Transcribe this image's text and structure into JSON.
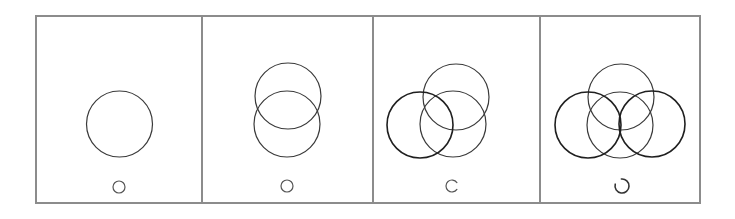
{
  "diagram": {
    "frame": {
      "x": 36,
      "y": 16,
      "width": 664,
      "height": 187,
      "color": "#8c8c8c"
    },
    "dividers_x": [
      202,
      373,
      540
    ],
    "line_color": "#3a3a3a",
    "panels": [
      {
        "id": "panel-1",
        "circles": [
          {
            "cx": 119.5,
            "cy": 124,
            "r": 33,
            "weight": "normal"
          }
        ],
        "marker": {
          "type": "circle",
          "cx": 119,
          "cy": 187,
          "r": 6
        }
      },
      {
        "id": "panel-2",
        "circles": [
          {
            "cx": 288,
            "cy": 96,
            "r": 33,
            "weight": "normal"
          },
          {
            "cx": 287,
            "cy": 124,
            "r": 33,
            "weight": "normal"
          }
        ],
        "marker": {
          "type": "circle",
          "cx": 287,
          "cy": 186,
          "r": 6
        }
      },
      {
        "id": "panel-3",
        "circles": [
          {
            "cx": 456,
            "cy": 97,
            "r": 33,
            "weight": "normal"
          },
          {
            "cx": 453,
            "cy": 124,
            "r": 33,
            "weight": "normal"
          },
          {
            "cx": 420,
            "cy": 125,
            "r": 33,
            "weight": "dark"
          }
        ],
        "marker": {
          "type": "arc-c",
          "cx": 452,
          "cy": 186,
          "r": 6
        }
      },
      {
        "id": "panel-4",
        "circles": [
          {
            "cx": 621,
            "cy": 97,
            "r": 33,
            "weight": "normal"
          },
          {
            "cx": 620,
            "cy": 125,
            "r": 33,
            "weight": "normal"
          },
          {
            "cx": 588,
            "cy": 125,
            "r": 33,
            "weight": "dark"
          },
          {
            "cx": 652,
            "cy": 124,
            "r": 33,
            "weight": "dark"
          }
        ],
        "marker": {
          "type": "arc-open-upper-left",
          "cx": 622,
          "cy": 186,
          "r": 7
        }
      }
    ]
  }
}
